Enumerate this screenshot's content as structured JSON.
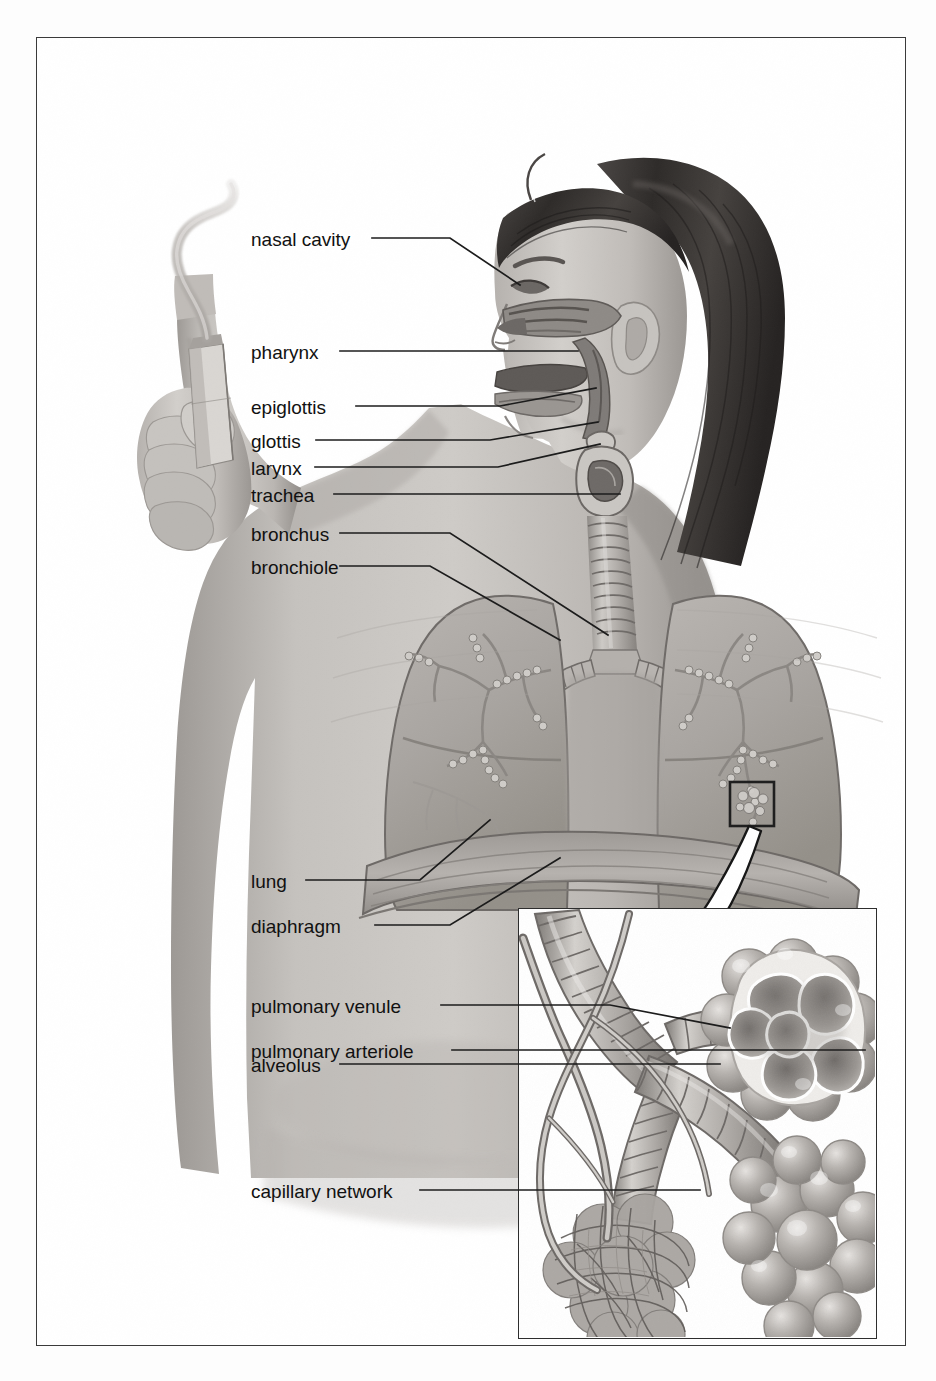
{
  "figure": {
    "title": "The Respiratory System",
    "kind": "labeled anatomical illustration"
  },
  "labels": {
    "nasal_cavity": "nasal cavity",
    "pharynx": "pharynx",
    "epiglottis": "epiglottis",
    "glottis": "glottis",
    "larynx": "larynx",
    "trachea": "trachea",
    "bronchus": "bronchus",
    "bronchiole": "bronchiole",
    "lung": "lung",
    "diaphragm": "diaphragm",
    "pulmonary_venule": "pulmonary venule",
    "pulmonary_arteriole": "pulmonary arteriole",
    "alveolus": "alveolus",
    "capillary_network": "capillary network"
  },
  "callout": {
    "box_label": "magnified-region-box",
    "arrow_label": "magnification-arrow",
    "inset_label": "alveoli-detail-inset"
  },
  "colors": {
    "page_background": "#fdfdfd",
    "frame_border": "#3a3a3a",
    "inset_border": "#2d2d2d",
    "label_text": "#111111",
    "title_text": "#1a1a1a",
    "leader_line": "#1c1c1c",
    "skin_light": "#c9c6c2",
    "skin_mid": "#aca8a4",
    "skin_dark": "#8d8884",
    "hair_dark": "#3b3836",
    "organ_mid": "#b5b1ad",
    "organ_dark": "#8f8b87"
  }
}
